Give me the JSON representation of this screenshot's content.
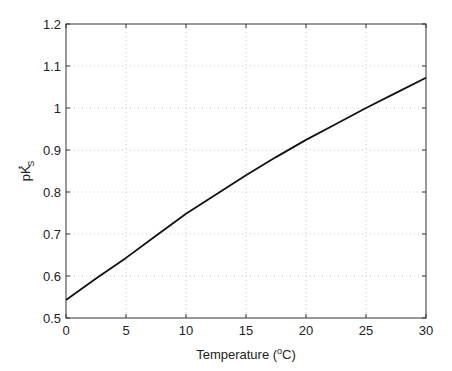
{
  "chart_data": {
    "type": "line",
    "title": "",
    "xlabel": "Temperature (°C)",
    "xlabel_parts": {
      "pre": "Temperature (",
      "sup": "o",
      "post": "C)"
    },
    "ylabel": "pK*_S",
    "ylabel_parts": {
      "base": "pK",
      "sup": "*",
      "sub": "S"
    },
    "xlim": [
      0,
      30
    ],
    "ylim": [
      0.5,
      1.2
    ],
    "xticks": [
      0,
      5,
      10,
      15,
      20,
      25,
      30
    ],
    "yticks": [
      0.5,
      0.6,
      0.7,
      0.8,
      0.9,
      1,
      1.1,
      1.2
    ],
    "xtick_labels": [
      "0",
      "5",
      "10",
      "15",
      "20",
      "25",
      "30"
    ],
    "ytick_labels": [
      "0.5",
      "0.6",
      "0.7",
      "0.8",
      "0.9",
      "1",
      "1.1",
      "1.2"
    ],
    "grid": true,
    "legend": null,
    "series": [
      {
        "name": "pK*_S",
        "color": "#111111",
        "x": [
          0,
          2.5,
          5,
          7.5,
          10,
          12.5,
          15,
          17.5,
          20,
          22.5,
          25,
          27.5,
          30
        ],
        "y": [
          0.543,
          0.594,
          0.643,
          0.696,
          0.748,
          0.794,
          0.84,
          0.883,
          0.924,
          0.962,
          1.0,
          1.036,
          1.072
        ]
      }
    ]
  }
}
